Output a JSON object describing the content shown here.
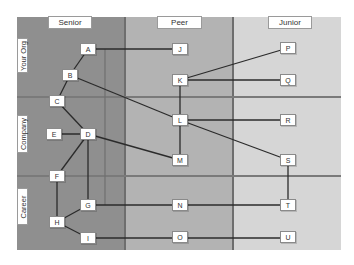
{
  "colors": {
    "senior_bg": "#8f8f8f",
    "peer_bg": "#b3b3b3",
    "junior_bg": "#d6d6d6",
    "edge": "#2b2b2b",
    "guide": "#6f6f6f",
    "node_bg": "#ffffff"
  },
  "columns": [
    {
      "label": "Senior"
    },
    {
      "label": "Peer"
    },
    {
      "label": "Junior"
    }
  ],
  "rows": [
    {
      "label": "Your Org"
    },
    {
      "label": "Company"
    },
    {
      "label": "Career"
    }
  ],
  "nodes": {
    "A": "A",
    "B": "B",
    "C": "C",
    "D": "D",
    "E": "E",
    "F": "F",
    "G": "G",
    "H": "H",
    "I": "I",
    "J": "J",
    "K": "K",
    "L": "L",
    "M": "M",
    "N": "N",
    "O": "O",
    "P": "P",
    "Q": "Q",
    "R": "R",
    "S": "S",
    "T": "T",
    "U": "U"
  },
  "edges": [
    [
      "A",
      "J"
    ],
    [
      "A",
      "B"
    ],
    [
      "B",
      "C"
    ],
    [
      "B",
      "L"
    ],
    [
      "C",
      "D"
    ],
    [
      "E",
      "D"
    ],
    [
      "D",
      "M"
    ],
    [
      "D",
      "F"
    ],
    [
      "D",
      "G"
    ],
    [
      "F",
      "H"
    ],
    [
      "G",
      "H"
    ],
    [
      "H",
      "I"
    ],
    [
      "G",
      "N"
    ],
    [
      "N",
      "T"
    ],
    [
      "I",
      "O"
    ],
    [
      "O",
      "U"
    ],
    [
      "K",
      "P"
    ],
    [
      "K",
      "Q"
    ],
    [
      "K",
      "L"
    ],
    [
      "L",
      "M"
    ],
    [
      "L",
      "R"
    ],
    [
      "L",
      "S"
    ],
    [
      "S",
      "T"
    ]
  ]
}
